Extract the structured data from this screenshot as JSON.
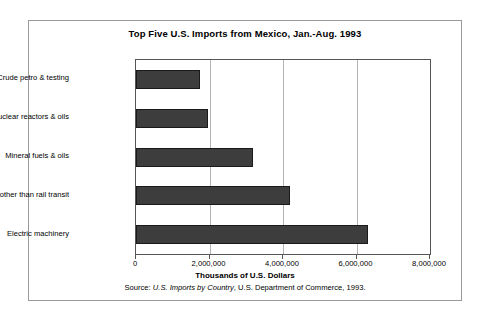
{
  "chart_data": {
    "type": "bar",
    "orientation": "horizontal",
    "title": "Top Five U.S. Imports from Mexico, Jan.-Aug. 1993",
    "xlabel": "Thousands of U.S. Dollars",
    "ylabel": "",
    "xlim": [
      0,
      8000000
    ],
    "xticks": [
      0,
      2000000,
      4000000,
      6000000,
      8000000
    ],
    "xtick_labels": [
      "0",
      "2,000,000",
      "4,000,000",
      "6,000,000",
      "8,000,000"
    ],
    "grid": true,
    "grid_axis": "x",
    "legend": false,
    "categories": [
      "Crude petro & testing",
      "Nuclear reactors & oils",
      "Mineral fuels & oils",
      "Vehicles other than rail transit",
      "Electric machinery"
    ],
    "values": [
      1750000,
      1950000,
      3180000,
      4200000,
      6300000
    ],
    "bar_color": "#3d3d3d",
    "bar_edge_color": "#1a1a1a"
  },
  "source": {
    "prefix": "Source: ",
    "italic_title": "U.S. Imports by Country",
    "suffix": ", U.S. Department of Commerce, 1993."
  }
}
